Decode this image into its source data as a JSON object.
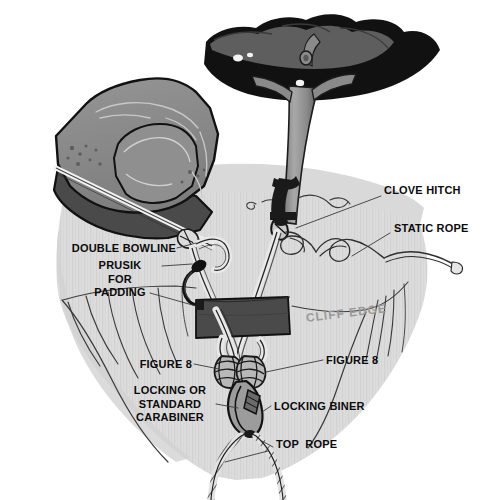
{
  "diagram": {
    "background_color": "#ffffff",
    "rock_color": "#dcdcdc",
    "rock_shadow_color": "#cfcfcf",
    "boulder_top_color": "#8a8a8a",
    "boulder_base_color": "#4a4a4a",
    "pad_color": "#4a4a4a",
    "tree_foliage_dark": "#111111",
    "tree_foliage_mid": "#5e5e5e",
    "tree_trunk_color": "#9a9a9a",
    "rope_color": "#d8d8d8",
    "rope_outline": "#2a2a2a",
    "label_color": "#0b0b0b",
    "cliff_edge_label_color": "#9a9a9a"
  },
  "labels": {
    "clove_hitch": "CLOVE HITCH",
    "static_rope": "STATIC ROPE",
    "double_bowline": "DOUBLE BOWLINE",
    "prusik_for_padding": "PRUSIK\nFOR\nPADDING",
    "cliff_edge": "CLIFF EDGE",
    "figure_8_left": "FIGURE 8",
    "figure_8_right": "FIGURE 8",
    "locking_or_standard_carabiner": "LOCKING OR\nSTANDARD\nCARABINER",
    "locking_biner": "LOCKING BINER",
    "top_rope": "TOP  ROPE"
  },
  "elements": {
    "boulder": "natural rock anchor block",
    "tree": "tree anchor with sling",
    "padding_block": "rope padding at cliff edge",
    "cliff_face": "vertical cliff with cracks",
    "knot_cluster": "two figure-8 knots into locking carabiner",
    "hanging_rope": "top rope doubled strand"
  }
}
